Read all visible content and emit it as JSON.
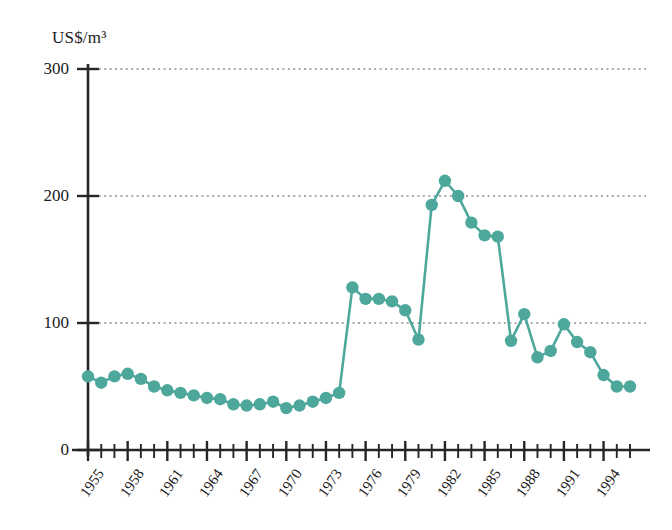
{
  "chart_data": {
    "type": "line",
    "title": "",
    "subtitle": "",
    "xlabel": "",
    "ylabel": "US$/m³",
    "ylim": [
      0,
      300
    ],
    "xlim": [
      1955,
      1996
    ],
    "yticks": [
      0,
      100,
      200,
      300
    ],
    "ytick_labels": [
      "0",
      "100",
      "200",
      "300"
    ],
    "xtick_labels": [
      "1955",
      "1958",
      "1961",
      "1964",
      "1967",
      "1970",
      "1973",
      "1976",
      "1979",
      "1982",
      "1985",
      "1988",
      "1991",
      "1994"
    ],
    "xtick_years": [
      1955,
      1958,
      1961,
      1964,
      1967,
      1970,
      1973,
      1976,
      1979,
      1982,
      1985,
      1988,
      1991,
      1994
    ],
    "grid": "horizontal-dotted",
    "legend": "none",
    "marker": "circle",
    "series": [
      {
        "name": "Price",
        "color": "#4DA89B",
        "x": [
          1955,
          1956,
          1957,
          1958,
          1959,
          1960,
          1961,
          1962,
          1963,
          1964,
          1965,
          1966,
          1967,
          1968,
          1969,
          1970,
          1971,
          1972,
          1973,
          1974,
          1975,
          1976,
          1977,
          1978,
          1979,
          1980,
          1981,
          1982,
          1983,
          1984,
          1985,
          1986,
          1987,
          1988,
          1989,
          1990,
          1991,
          1992,
          1993,
          1994,
          1995,
          1996
        ],
        "values": [
          58,
          53,
          58,
          60,
          56,
          50,
          47,
          45,
          43,
          41,
          40,
          36,
          35,
          36,
          38,
          33,
          35,
          38,
          41,
          45,
          128,
          119,
          119,
          117,
          110,
          87,
          193,
          212,
          200,
          179,
          169,
          168,
          86,
          107,
          73,
          78,
          99,
          85,
          77,
          59,
          50,
          50
        ]
      }
    ]
  },
  "axes": {
    "unit_label": "US$/m³"
  }
}
